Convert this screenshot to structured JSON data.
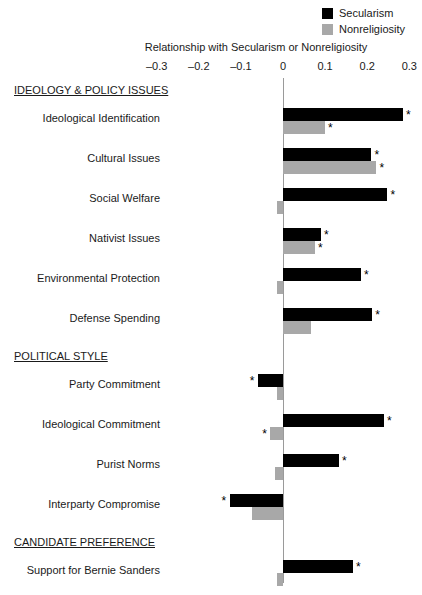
{
  "legend": {
    "items": [
      {
        "label": "Secularism",
        "color": "#000000"
      },
      {
        "label": "Nonreligiosity",
        "color": "#a8a8a8"
      }
    ]
  },
  "axis": {
    "title": "Relationship with Secularism or Nonreligiosity",
    "tick_labels": [
      "–0.3",
      "–0.2",
      "–0.1",
      "0",
      "0.1",
      "0.2",
      "0.3"
    ]
  },
  "chart_data": {
    "type": "bar",
    "orientation": "horizontal",
    "title": "",
    "xlabel": "Relationship with Secularism or Nonreligiosity",
    "ylabel": "",
    "xlim": [
      -0.3,
      0.3
    ],
    "xticks": [
      -0.3,
      -0.2,
      -0.1,
      0,
      0.1,
      0.2,
      0.3
    ],
    "grid": false,
    "legend_position": "top-right",
    "zero_reference_line": true,
    "significance_marker": "*",
    "series": [
      {
        "name": "Secularism",
        "color": "#000000"
      },
      {
        "name": "Nonreligiosity",
        "color": "#a8a8a8"
      }
    ],
    "sections": [
      {
        "header": "IDEOLOGY & POLICY ISSUES",
        "categories": [
          {
            "label": "Ideological Identification",
            "secularism": {
              "value": 0.285,
              "significant": true
            },
            "nonreligiosity": {
              "value": 0.1,
              "significant": true
            }
          },
          {
            "label": "Cultural Issues",
            "secularism": {
              "value": 0.21,
              "significant": true
            },
            "nonreligiosity": {
              "value": 0.222,
              "significant": true
            }
          },
          {
            "label": "Social Welfare",
            "secularism": {
              "value": 0.248,
              "significant": true
            },
            "nonreligiosity": {
              "value": -0.01,
              "significant": false
            }
          },
          {
            "label": "Nativist Issues",
            "secularism": {
              "value": 0.09,
              "significant": true
            },
            "nonreligiosity": {
              "value": 0.076,
              "significant": true
            }
          },
          {
            "label": "Environmental Protection",
            "secularism": {
              "value": 0.185,
              "significant": true
            },
            "nonreligiosity": {
              "value": -0.012,
              "significant": false
            }
          },
          {
            "label": "Defense Spending",
            "secularism": {
              "value": 0.212,
              "significant": true
            },
            "nonreligiosity": {
              "value": 0.067,
              "significant": false
            }
          }
        ]
      },
      {
        "header": "POLITICAL STYLE",
        "categories": [
          {
            "label": "Party Commitment",
            "secularism": {
              "value": -0.06,
              "significant": true
            },
            "nonreligiosity": {
              "value": -0.012,
              "significant": false
            }
          },
          {
            "label": "Ideological Commitment",
            "secularism": {
              "value": 0.24,
              "significant": true
            },
            "nonreligiosity": {
              "value": -0.03,
              "significant": true
            }
          },
          {
            "label": "Purist Norms",
            "secularism": {
              "value": 0.133,
              "significant": true
            },
            "nonreligiosity": {
              "value": -0.018,
              "significant": false
            }
          },
          {
            "label": "Interparty Compromise",
            "secularism": {
              "value": -0.127,
              "significant": true
            },
            "nonreligiosity": {
              "value": -0.073,
              "significant": false
            }
          }
        ]
      },
      {
        "header": "CANDIDATE PREFERENCE",
        "categories": [
          {
            "label": "Support for Bernie Sanders",
            "secularism": {
              "value": 0.166,
              "significant": true
            },
            "nonreligiosity": {
              "value": -0.014,
              "significant": false
            }
          }
        ]
      }
    ]
  }
}
